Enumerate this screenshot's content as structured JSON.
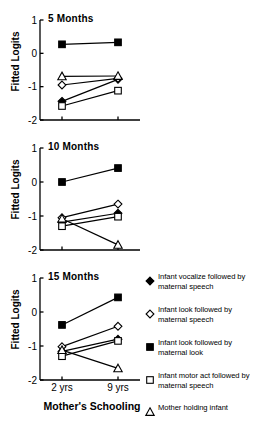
{
  "figure": {
    "ylabel": "Fitted Logits",
    "xlabel": "Mother's Schooling",
    "x_ticks": [
      "2 yrs",
      "9 yrs"
    ],
    "y_ticks": [
      "1",
      "0",
      "-1",
      "-2"
    ],
    "ylim": [
      -2,
      1
    ],
    "line_color": "#000000",
    "background": "#ffffff"
  },
  "legend": {
    "items": [
      {
        "marker": "filled-diamond-marker",
        "label": "Infant vocalize followed by maternal speech"
      },
      {
        "marker": "open-diamond-marker",
        "label": "Infant look followed by maternal speech"
      },
      {
        "marker": "filled-square-marker",
        "label": "Infant look followed by maternal look"
      },
      {
        "marker": "open-square-marker",
        "label": "Infant motor act followed by maternal speech"
      },
      {
        "marker": "open-triangle-marker",
        "label": "Mother holding infant"
      }
    ]
  },
  "chart_data": [
    {
      "type": "line",
      "title": "5 Months",
      "xlabel": "Mother's Schooling",
      "ylabel": "Fitted Logits",
      "x": [
        "2 yrs",
        "9 yrs"
      ],
      "ylim": [
        -2,
        1
      ],
      "yticks": [
        1,
        0,
        -1,
        -2
      ],
      "grid": false,
      "legend_position": "right",
      "series": [
        {
          "name": "Infant vocalize followed by maternal speech",
          "marker": "filled-diamond",
          "values": [
            -1.44,
            -0.78
          ]
        },
        {
          "name": "Infant look followed by maternal speech",
          "marker": "open-diamond",
          "values": [
            -0.95,
            -0.75
          ]
        },
        {
          "name": "Infant look followed by maternal look",
          "marker": "filled-square",
          "values": [
            0.27,
            0.33
          ]
        },
        {
          "name": "Infant motor act followed by maternal speech",
          "marker": "open-square",
          "values": [
            -1.58,
            -1.12
          ]
        },
        {
          "name": "Mother holding infant",
          "marker": "open-triangle",
          "values": [
            -0.69,
            -0.68
          ]
        }
      ]
    },
    {
      "type": "line",
      "title": "10 Months",
      "xlabel": "Mother's Schooling",
      "ylabel": "Fitted Logits",
      "x": [
        "2 yrs",
        "9 yrs"
      ],
      "ylim": [
        -2,
        1
      ],
      "yticks": [
        1,
        0,
        -1,
        -2
      ],
      "grid": false,
      "legend_position": "right",
      "series": [
        {
          "name": "Infant vocalize followed by maternal speech",
          "marker": "filled-diamond",
          "values": [
            -1.18,
            -0.92
          ]
        },
        {
          "name": "Infant look followed by maternal speech",
          "marker": "open-diamond",
          "values": [
            -1.05,
            -0.65
          ]
        },
        {
          "name": "Infant look followed by maternal look",
          "marker": "filled-square",
          "values": [
            0.0,
            0.41
          ]
        },
        {
          "name": "Infant motor act followed by maternal speech",
          "marker": "open-square",
          "values": [
            -1.3,
            -1.02
          ]
        },
        {
          "name": "Mother holding infant",
          "marker": "open-triangle",
          "values": [
            -1.08,
            -1.85
          ]
        }
      ]
    },
    {
      "type": "line",
      "title": "15 Months",
      "xlabel": "Mother's Schooling",
      "ylabel": "Fitted Logits",
      "x": [
        "2 yrs",
        "9 yrs"
      ],
      "ylim": [
        -2,
        1
      ],
      "yticks": [
        1,
        0,
        -1,
        -2
      ],
      "grid": false,
      "legend_position": "right",
      "series": [
        {
          "name": "Infant vocalize followed by maternal speech",
          "marker": "filled-diamond",
          "values": [
            -1.16,
            -0.8
          ]
        },
        {
          "name": "Infant look followed by maternal speech",
          "marker": "open-diamond",
          "values": [
            -1.02,
            -0.42
          ]
        },
        {
          "name": "Infant look followed by maternal look",
          "marker": "filled-square",
          "values": [
            -0.38,
            0.43
          ]
        },
        {
          "name": "Infant motor act followed by maternal speech",
          "marker": "open-square",
          "values": [
            -1.3,
            -0.85
          ]
        },
        {
          "name": "Mother holding infant",
          "marker": "open-triangle",
          "values": [
            -1.12,
            -1.66
          ]
        }
      ]
    }
  ]
}
